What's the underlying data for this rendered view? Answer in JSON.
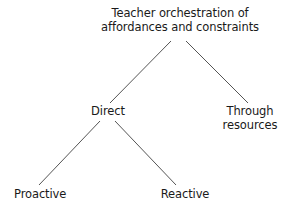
{
  "diagram": {
    "type": "tree",
    "root": {
      "label_lines": [
        "Teacher orchestration of",
        "affordances and constraints"
      ]
    },
    "children": [
      {
        "id": "direct",
        "label_lines": [
          "Direct"
        ],
        "children": [
          {
            "id": "proactive",
            "label_lines": [
              "Proactive"
            ]
          },
          {
            "id": "reactive",
            "label_lines": [
              "Reactive"
            ]
          }
        ]
      },
      {
        "id": "through-resources",
        "label_lines": [
          "Through",
          "resources"
        ]
      }
    ],
    "edges": [
      {
        "from": "root",
        "to": "direct",
        "x1": 171,
        "y1": 41,
        "x2": 110,
        "y2": 103
      },
      {
        "from": "root",
        "to": "through-resources",
        "x1": 186,
        "y1": 41,
        "x2": 248,
        "y2": 103
      },
      {
        "from": "direct",
        "to": "proactive",
        "x1": 100,
        "y1": 121,
        "x2": 39,
        "y2": 185
      },
      {
        "from": "direct",
        "to": "reactive",
        "x1": 115,
        "y1": 121,
        "x2": 176,
        "y2": 185
      }
    ],
    "colors": {
      "line": "#555555",
      "text": "#1a1a1a",
      "background": "#ffffff"
    }
  }
}
